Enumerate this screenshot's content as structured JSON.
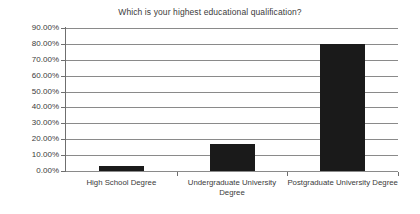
{
  "chart_data": {
    "type": "bar",
    "title": "Which is your highest educational qualification?",
    "xlabel": "",
    "ylabel": "",
    "categories": [
      "High School Degree",
      "Undergraduate University Degree",
      "Postgraduate University Degree"
    ],
    "values": [
      3,
      17,
      80
    ],
    "value_labels": [
      "3.00%",
      "17.00%",
      "80.00%"
    ],
    "ylim": [
      0,
      90
    ],
    "ytick_labels": [
      "90.00%",
      "80.00%",
      "70.00%",
      "60.00%",
      "50.00%",
      "40.00%",
      "30.00%",
      "20.00%",
      "10.00%",
      "0.00%"
    ],
    "ytick_values": [
      90,
      80,
      70,
      60,
      50,
      40,
      30,
      20,
      10,
      0
    ],
    "grid": true,
    "legend": false,
    "legend_position": "none",
    "colors": {
      "bar": "#1a1a1a",
      "gridline": "#8a8a8a",
      "axis": "#6f6f6f",
      "text": "#3b3b3b",
      "background": "#ffffff"
    }
  }
}
